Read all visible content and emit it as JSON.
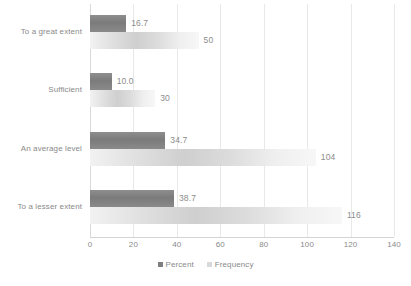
{
  "chart_data": {
    "type": "bar",
    "orientation": "horizontal",
    "title": "",
    "subtitle": "",
    "xlabel": "",
    "ylabel": "",
    "categories": [
      "To a great extent",
      "Sufficient",
      "An average level",
      "To a lesser extent"
    ],
    "series": [
      {
        "name": "Percent",
        "color": "#7f7f7f",
        "values": [
          16.7,
          10.0,
          34.7,
          38.7
        ],
        "labels": [
          "16.7",
          "10.0",
          "34.7",
          "38.7"
        ]
      },
      {
        "name": "Frequency",
        "color": "#d9d9d9",
        "values": [
          50,
          30,
          104,
          116
        ],
        "labels": [
          "50",
          "30",
          "104",
          "116"
        ]
      }
    ],
    "xlim": [
      0,
      140
    ],
    "xticks": [
      0,
      20,
      40,
      60,
      80,
      100,
      120,
      140
    ],
    "xtick_labels": [
      "0",
      "20",
      "40",
      "60",
      "80",
      "100",
      "120",
      "140"
    ],
    "grid": true,
    "grid_axis": "x",
    "legend": true,
    "legend_position": "bottom",
    "data_labels": true
  },
  "legend": {
    "items": [
      {
        "label": "Percent",
        "color": "#7f7f7f"
      },
      {
        "label": "Frequency",
        "color": "#d9d9d9"
      }
    ]
  }
}
